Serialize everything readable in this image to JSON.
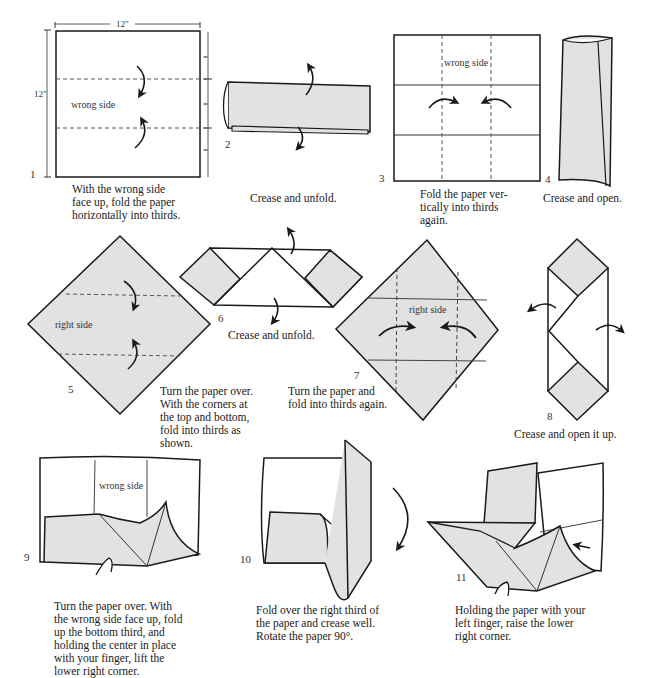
{
  "colors": {
    "paper_colored": "#e2e2e2",
    "paper_white": "#ffffff",
    "line": "#1a1a1a",
    "crease": "#555555"
  },
  "dimensions": {
    "width_label": "12\"",
    "height_label": "12\"",
    "equal_mark": "="
  },
  "steps": [
    {
      "number": "1",
      "label": "wrong side",
      "caption": [
        "With the wrong side",
        "face up, fold the paper",
        "horizontally into thirds."
      ]
    },
    {
      "number": "2",
      "label": "",
      "caption": [
        "Crease and unfold."
      ]
    },
    {
      "number": "3",
      "label": "wrong side",
      "caption": [
        "Fold the paper ver-",
        "tically into thirds",
        "again."
      ]
    },
    {
      "number": "4",
      "label": "",
      "caption": [
        "Crease and open."
      ]
    },
    {
      "number": "5",
      "label": "right side",
      "caption": [
        "Turn the paper over.",
        "With the corners at",
        "the top and bottom,",
        "fold into thirds as",
        "shown."
      ]
    },
    {
      "number": "6",
      "label": "",
      "caption": [
        "Crease and unfold."
      ]
    },
    {
      "number": "7",
      "label": "right side",
      "caption": [
        "Turn the paper and",
        "fold into thirds again."
      ]
    },
    {
      "number": "8",
      "label": "",
      "caption": [
        "Crease and open it up."
      ]
    },
    {
      "number": "9",
      "label": "wrong side",
      "caption": [
        "Turn the paper over. With",
        "the wrong side face up, fold",
        "up the bottom third, and",
        "holding the center in place",
        "with your finger, lift the",
        "lower right corner."
      ]
    },
    {
      "number": "10",
      "label": "",
      "caption": [
        "Fold over the right third of",
        "the paper and crease well.",
        "Rotate the paper 90°."
      ]
    },
    {
      "number": "11",
      "label": "",
      "caption": [
        "Holding the paper with your",
        "left finger, raise the lower",
        "right corner."
      ]
    }
  ]
}
